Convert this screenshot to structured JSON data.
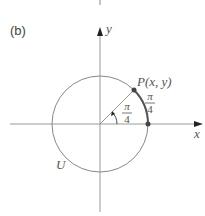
{
  "figure": {
    "panel_label": "(b)",
    "axis_x_label": "x",
    "axis_y_label": "y",
    "point_label": "P(x, y)",
    "circle_label": "U",
    "arc_angle_numerator": "π",
    "arc_angle_denominator": "4",
    "central_angle_numerator": "π",
    "central_angle_denominator": "4"
  }
}
